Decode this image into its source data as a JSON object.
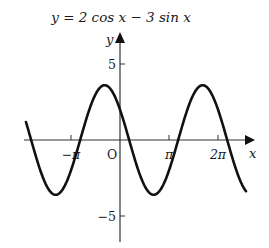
{
  "chart_data": {
    "type": "line",
    "title": "y = 2 cos x − 3 sin x",
    "xlabel": "x",
    "ylabel": "y",
    "origin_label": "O",
    "x_ticks": [
      {
        "value": -3.14159,
        "label": "−π"
      },
      {
        "value": 3.14159,
        "label": "π"
      },
      {
        "value": 6.28319,
        "label": "2π"
      }
    ],
    "y_ticks": [
      {
        "value": 5,
        "label": "5"
      },
      {
        "value": -5,
        "label": "−5"
      }
    ],
    "xlim": [
      -6.2,
      8.4
    ],
    "ylim": [
      -6.7,
      7.0
    ],
    "grid": false,
    "legend": null,
    "series": [
      {
        "name": "y = 2 cos x − 3 sin x",
        "function": "2*cos(x) - 3*sin(x)",
        "domain": [
          -6.03,
          8.08
        ],
        "amplitude": 3.606,
        "maxima_x": [
          -0.983,
          5.3
        ],
        "minima_x": [
          -4.124,
          2.159
        ],
        "zeros_x": [
          -5.695,
          -2.554,
          0.588,
          3.729,
          6.871
        ]
      }
    ]
  },
  "layout": {
    "origin_px": [
      120,
      140
    ],
    "px_per_unit_x": 15.6,
    "px_per_unit_y": 15.2
  }
}
